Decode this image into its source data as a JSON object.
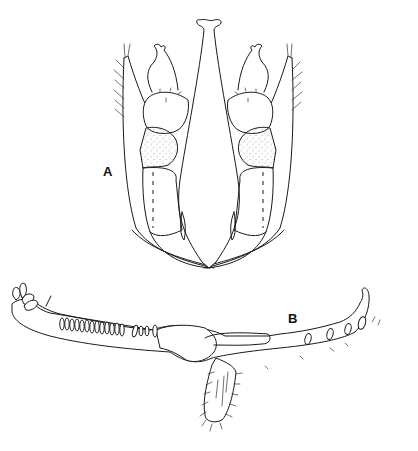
{
  "figure": {
    "panels": [
      {
        "id": "A",
        "label": "A",
        "description": "Mouthpart structure, ventral view (labium with palps and stipes)"
      },
      {
        "id": "B",
        "label": "B",
        "description": "Elongate mandible/lacinia with row of teeth and setose lobe"
      }
    ],
    "colors": {
      "line": "#1a1a1a",
      "background": "#ffffff",
      "stipple": "#555555"
    }
  }
}
